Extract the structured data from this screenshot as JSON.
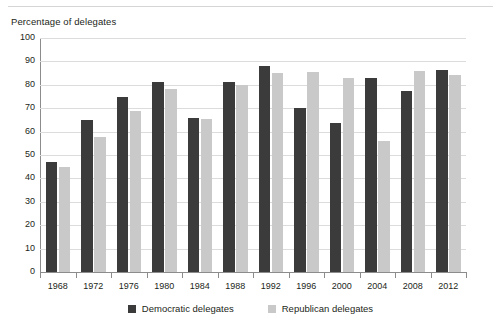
{
  "axis_title": "Percentage of delegates",
  "chart_data": {
    "type": "bar",
    "title": "",
    "subtitle": "",
    "xlabel": "",
    "ylabel": "Percentage of delegates",
    "ylim": [
      0,
      100
    ],
    "ytick_step": 10,
    "yticks": [
      0,
      10,
      20,
      30,
      40,
      50,
      60,
      70,
      80,
      90,
      100
    ],
    "ytick_labels": [
      "0",
      "10",
      "20",
      "30",
      "40",
      "50",
      "60",
      "70",
      "80",
      "90",
      "100"
    ],
    "grid": true,
    "grid_axis": "y",
    "legend_position": "bottom-center",
    "categories": [
      "1968",
      "1972",
      "1976",
      "1980",
      "1984",
      "1988",
      "1992",
      "1996",
      "2000",
      "2004",
      "2008",
      "2012"
    ],
    "series": [
      {
        "name": "Democratic delegates",
        "color": "#3b3b3b",
        "values": [
          47,
          65,
          75,
          81,
          66,
          81,
          88,
          70,
          63.5,
          83,
          77.5,
          86.5
        ]
      },
      {
        "name": "Republican delegates",
        "color": "#c9c9c9",
        "values": [
          45,
          57.5,
          69,
          78,
          65.5,
          80,
          85,
          85.5,
          83,
          56,
          86,
          84
        ]
      }
    ]
  },
  "legend": [
    {
      "label": "Democratic delegates",
      "swatch": "dem"
    },
    {
      "label": "Republican delegates",
      "swatch": "rep"
    }
  ],
  "colors": {
    "democratic": "#3b3b3b",
    "republican": "#c9c9c9",
    "axis": "#8c8c8c",
    "grid": "#dcdcdc",
    "text": "#231f20",
    "background": "#ffffff"
  }
}
